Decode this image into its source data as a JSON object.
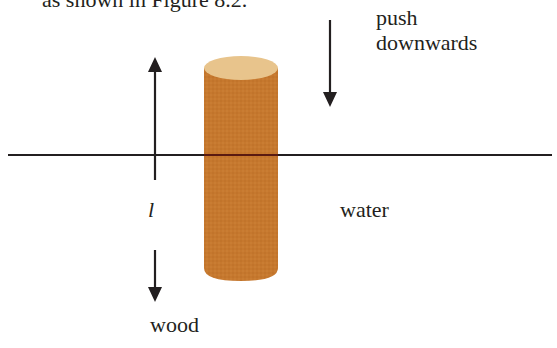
{
  "caption": "as shown in Figure 8.2.",
  "labels": {
    "push": "push",
    "downwards": "downwards",
    "water": "water",
    "wood": "wood",
    "length": "l"
  },
  "colors": {
    "wood_body": "#C6782E",
    "wood_top": "#E8C48C",
    "line": "#231f20"
  },
  "diagram": {
    "water_line_y": 155,
    "cylinder": {
      "x": 204,
      "width": 74,
      "top": 68,
      "bottom": 280
    },
    "arrows": [
      {
        "name": "length-up-arrow",
        "x": 155,
        "from": 180,
        "to": 57
      },
      {
        "name": "length-down-arrow",
        "x": 155,
        "from": 250,
        "to": 302
      },
      {
        "name": "push-down-arrow",
        "x": 330,
        "from": 20,
        "to": 107
      }
    ]
  }
}
